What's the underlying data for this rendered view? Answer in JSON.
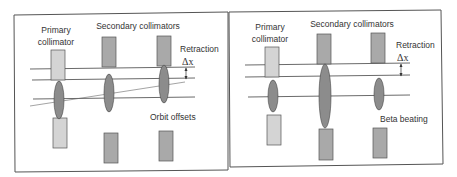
{
  "panels": [
    {
      "id": "left",
      "primary_label_1": "Primary",
      "primary_label_2": "collimator",
      "secondary_label": "Secondary collimators",
      "retraction_label": "Retraction",
      "delta_label": "Δx",
      "effect_label": "Orbit offsets"
    },
    {
      "id": "right",
      "primary_label_1": "Primary",
      "primary_label_2": "collimator",
      "secondary_label": "Secondary collimators",
      "retraction_label": "Retraction",
      "delta_label": "Δx",
      "effect_label": "Beta beating"
    }
  ],
  "colors": {
    "primary_jaw": "#d4d4d4",
    "secondary_jaw": "#a9a9a9",
    "beam_ellipse": "#8c8c8c",
    "line": "#444444",
    "border": "#555555"
  }
}
